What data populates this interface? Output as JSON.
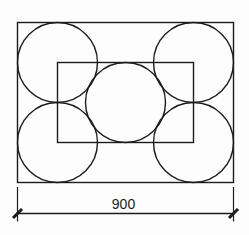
{
  "figure": {
    "background": "#fdfdfd",
    "stroke_color": "#1c1c1c",
    "outer_rect": {
      "x": 17.5,
      "y": 22.5,
      "width": 216,
      "height": 160
    },
    "inner_rect": {
      "x": 57.5,
      "y": 62.5,
      "width": 136,
      "height": 80
    },
    "circles": [
      {
        "name": "top-left",
        "cx": 57.5,
        "cy": 62.5,
        "r": 40
      },
      {
        "name": "top-right",
        "cx": 193.5,
        "cy": 62.5,
        "r": 40
      },
      {
        "name": "center",
        "cx": 125.5,
        "cy": 102.5,
        "r": 40
      },
      {
        "name": "bottom-left",
        "cx": 57.5,
        "cy": 142.5,
        "r": 40
      },
      {
        "name": "bottom-right",
        "cx": 193.5,
        "cy": 142.5,
        "r": 40
      }
    ],
    "dimension": {
      "label": "900",
      "x_start": 17.5,
      "x_end": 233.5,
      "line_y": 213.5,
      "ext_top": 187,
      "ext_bottom": 221.5,
      "tick_half": 4.5,
      "label_x": 123.5,
      "label_y": 209
    }
  }
}
